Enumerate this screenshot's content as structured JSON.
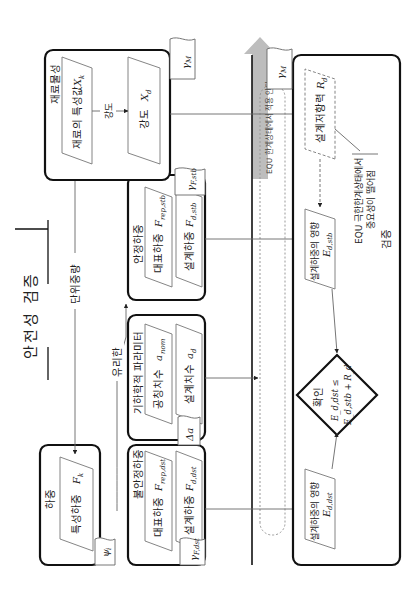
{
  "title": "안전성 검증",
  "groups": {
    "material": {
      "label": "재료물성"
    },
    "load": {
      "label": "하중"
    },
    "stable_load": {
      "label": "안정하중"
    },
    "geometry": {
      "label": "기하학적 파라미터"
    },
    "unstable_load": {
      "label": "불안정하중"
    },
    "verification": {
      "label": "검증"
    }
  },
  "nodes": {
    "material_char": {
      "text": "재료의 특성값",
      "symbol": "X",
      "sub": "k"
    },
    "strength_design": {
      "text": "강도",
      "symbol": "X",
      "sub": "d"
    },
    "char_load": {
      "text": "특성하중",
      "symbol": "F",
      "sub": "k"
    },
    "rep_stb": {
      "text": "대표하중",
      "symbol": "F",
      "sub": "rep,stb"
    },
    "design_stb": {
      "text": "설계하중",
      "symbol": "F",
      "sub": "d,stb"
    },
    "nominal_dim": {
      "text": "공칭치수",
      "symbol": "a",
      "sub": "nom"
    },
    "design_dim": {
      "text": "설계치수",
      "symbol": "a",
      "sub": "d"
    },
    "rep_dst": {
      "text": "대표하중",
      "symbol": "F",
      "sub": "rep,dst"
    },
    "design_dst": {
      "text": "설계하중",
      "symbol": "F",
      "sub": "d,dst"
    },
    "design_resistance": {
      "text": "설계저항력",
      "symbol": "R",
      "sub": "d"
    },
    "effect_stb": {
      "text": "설계하중의 영향",
      "symbol": "E",
      "sub": "d,stb"
    },
    "effect_dst": {
      "text": "설계하중의 영향",
      "symbol": "E",
      "sub": "d,dst"
    },
    "check": {
      "text": "확인",
      "line1": "E_d,dst ≤",
      "line2": "E_d,stb + R_d"
    }
  },
  "factors": {
    "gamma_M_top": {
      "symbol": "γ",
      "sub": "M"
    },
    "gamma_M_right": {
      "symbol": "γ",
      "sub": "M"
    },
    "gamma_F_stb": {
      "symbol": "γ",
      "sub": "F,stb"
    },
    "delta_a": {
      "symbol": "Δa",
      "sub": ""
    },
    "psi_i": {
      "symbol": "ψ",
      "sub": "i"
    },
    "gamma_F_dst": {
      "symbol": "γ",
      "sub": "F,dst"
    }
  },
  "edge_labels": {
    "strength": "강도",
    "unit_weight": "단위중량",
    "favorable": "유리한",
    "not_applied": "EQU 한계상태에서 적용 안됨"
  },
  "note": {
    "line1": "EQU 극한한계상태에서",
    "line2": "중요성이 떨어짐"
  }
}
